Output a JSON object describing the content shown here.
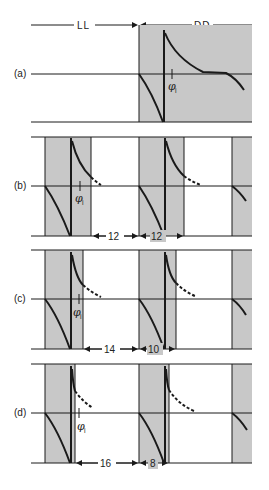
{
  "header": {
    "left_label": "LL",
    "right_label": "DD"
  },
  "panels": [
    {
      "id": "a",
      "label": "(a)",
      "phase_label": "φ",
      "phase_sub": "i"
    },
    {
      "id": "b",
      "label": "(b)",
      "phase_label": "φ",
      "phase_sub": "i",
      "intervals": [
        "12",
        "12"
      ]
    },
    {
      "id": "c",
      "label": "(c)",
      "phase_label": "φ",
      "phase_sub": "i",
      "intervals": [
        "14",
        "10"
      ]
    },
    {
      "id": "d",
      "label": "(d)",
      "phase_label": "φ",
      "phase_sub": "i",
      "intervals": [
        "16",
        "8"
      ]
    }
  ],
  "colors": {
    "shade": "#c8c8c8",
    "line": "#1a1a1a"
  }
}
